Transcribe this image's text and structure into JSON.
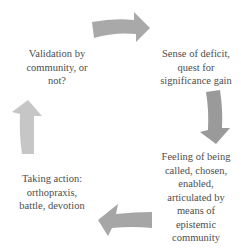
{
  "diagram": {
    "type": "cycle",
    "nodes": [
      {
        "id": "validation",
        "position": "top-left",
        "lines": [
          "Validation by",
          "community, or",
          "not?"
        ]
      },
      {
        "id": "deficit",
        "position": "top-right",
        "lines": [
          "Sense of deficit,",
          "quest for",
          "significance gain"
        ]
      },
      {
        "id": "feeling",
        "position": "bottom-right",
        "lines": [
          "Feeling of being",
          "called, chosen,",
          "enabled,",
          "articulated by",
          "means of",
          "epistemic",
          "community"
        ]
      },
      {
        "id": "action",
        "position": "bottom-left",
        "lines": [
          "Taking action:",
          "orthopraxis,",
          "battle, devotion"
        ]
      }
    ],
    "arrows": [
      {
        "id": "top",
        "direction": "right",
        "color": "#a9a9a9"
      },
      {
        "id": "right",
        "direction": "down",
        "color": "#9a9a9a"
      },
      {
        "id": "bottom",
        "direction": "left",
        "color": "#a6a6a6"
      },
      {
        "id": "left",
        "direction": "up",
        "color": "#c6c6c6"
      }
    ]
  }
}
